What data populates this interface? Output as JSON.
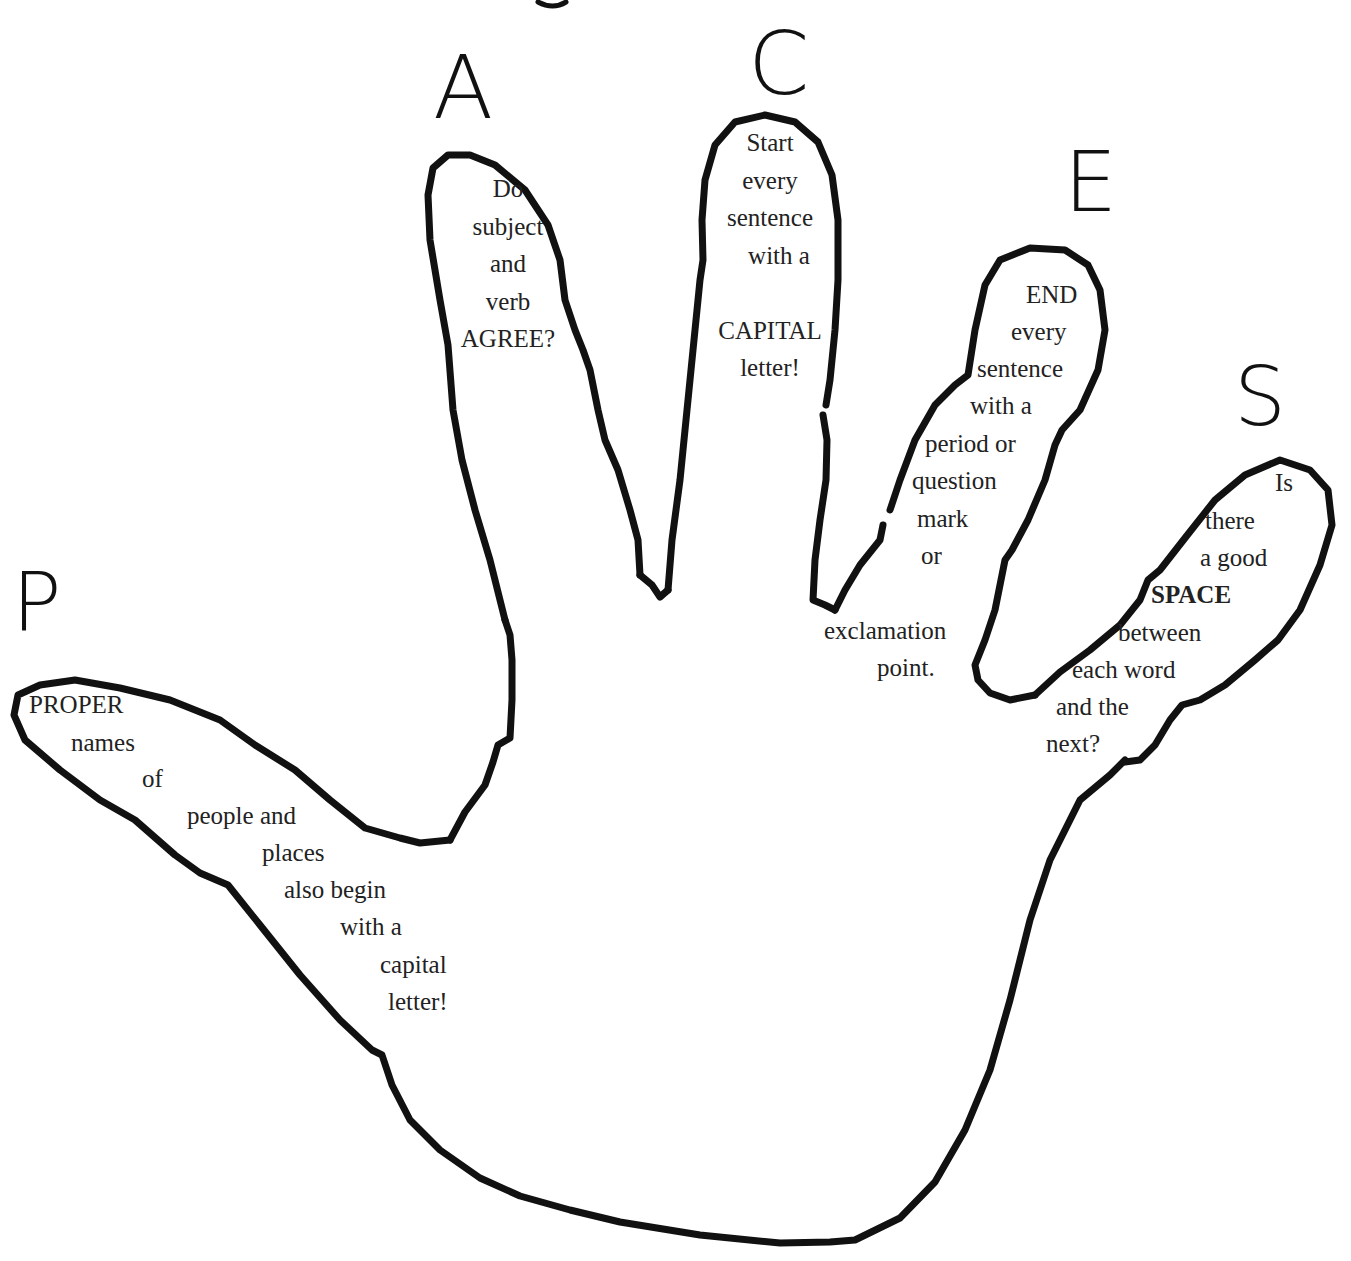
{
  "title_fragment": "g",
  "acronym_letters": {
    "P": "P",
    "A": "A",
    "C": "C",
    "E": "E",
    "S": "S"
  },
  "fingers": {
    "index_A": {
      "letter": "A",
      "lines": [
        "Do",
        "subject",
        "and",
        "verb",
        "AGREE?"
      ]
    },
    "middle_C": {
      "letter": "C",
      "lines": [
        "Start",
        "every",
        "sentence",
        "with a",
        "",
        "CAPITAL",
        "letter!"
      ]
    },
    "ring_E": {
      "letter": "E",
      "lines": [
        "END",
        "every",
        "sentence",
        "with a",
        "period or",
        "question",
        "mark",
        "or",
        "",
        "exclamation",
        "point."
      ]
    },
    "pinky_S": {
      "letter": "S",
      "lines": [
        "Is",
        "there",
        "a good",
        "SPACE",
        "between",
        "each word",
        "and the",
        "next?"
      ],
      "bold_word": "SPACE"
    },
    "thumb_P": {
      "letter": "P",
      "lines": [
        "PROPER",
        "names",
        "of",
        "people and",
        "places",
        "also begin",
        "with a",
        "capital",
        "letter!"
      ]
    }
  },
  "colors": {
    "outline": "#111111",
    "text": "#222222",
    "background": "#ffffff"
  }
}
